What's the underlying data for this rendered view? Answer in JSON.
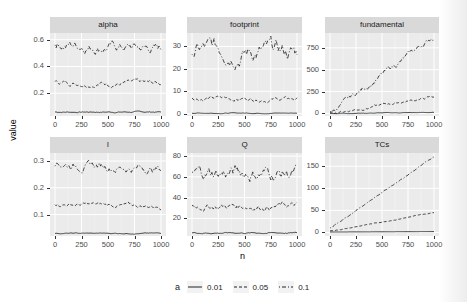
{
  "chart_data": {
    "type": "line",
    "layout": "facet_wrap 2x3, free y scales",
    "xlabel": "n",
    "ylabel": "value",
    "x_ticks": [
      "0",
      "250",
      "500",
      "750",
      "1000"
    ],
    "xlim": [
      0,
      1000
    ],
    "grid": true,
    "legend": {
      "title": "a",
      "position": "bottom",
      "entries": [
        {
          "label": "0.01",
          "linetype": "solid"
        },
        {
          "label": "0.05",
          "linetype": "dashed"
        },
        {
          "label": "0.1",
          "linetype": "dotdash"
        }
      ]
    },
    "panels": [
      {
        "title": "alpha",
        "y_ticks": [
          "0.2",
          "0.4",
          "0.6"
        ],
        "ylim": [
          0.03,
          0.65
        ],
        "series": [
          {
            "name": "0.01",
            "level": 0.06,
            "trend": 0,
            "noise": 0.003
          },
          {
            "name": "0.05",
            "level": 0.28,
            "trend": -0.01,
            "noise": 0.012
          },
          {
            "name": "0.1",
            "level": 0.57,
            "trend": -0.04,
            "noise": 0.025
          }
        ]
      },
      {
        "title": "footprint",
        "y_ticks": [
          "0",
          "10",
          "20",
          "30"
        ],
        "ylim": [
          -1,
          36
        ],
        "series": [
          {
            "name": "0.01",
            "level": 0.3,
            "trend": 0,
            "noise": 0.1
          },
          {
            "name": "0.05",
            "level": 7,
            "trend": -0.5,
            "noise": 0.6
          },
          {
            "name": "0.1",
            "level": 29,
            "trend": -2,
            "noise": 2.5
          }
        ]
      },
      {
        "title": "fundamental",
        "y_ticks": [
          "0",
          "250",
          "500",
          "750"
        ],
        "ylim": [
          -30,
          920
        ],
        "series": [
          {
            "name": "0.01",
            "level": 0,
            "trend": 10,
            "noise": 2
          },
          {
            "name": "0.05",
            "level": 0,
            "trend": 190,
            "noise": 10
          },
          {
            "name": "0.1",
            "level": 0,
            "trend": 880,
            "noise": 20
          }
        ]
      },
      {
        "title": "l",
        "y_ticks": [
          "0.1",
          "0.2",
          "0.3"
        ],
        "ylim": [
          0.02,
          0.33
        ],
        "series": [
          {
            "name": "0.01",
            "level": 0.03,
            "trend": 0,
            "noise": 0.001
          },
          {
            "name": "0.05",
            "level": 0.14,
            "trend": -0.01,
            "noise": 0.005
          },
          {
            "name": "0.1",
            "level": 0.29,
            "trend": -0.02,
            "noise": 0.01
          }
        ]
      },
      {
        "title": "Q",
        "y_ticks": [
          "20",
          "40",
          "60",
          "80"
        ],
        "ylim": [
          3,
          83
        ],
        "series": [
          {
            "name": "0.01",
            "level": 6,
            "trend": 0,
            "noise": 0.4
          },
          {
            "name": "0.05",
            "level": 32,
            "trend": 0,
            "noise": 2
          },
          {
            "name": "0.1",
            "level": 64,
            "trend": 0,
            "noise": 4.5
          }
        ]
      },
      {
        "title": "TCs",
        "y_ticks": [
          "0",
          "50",
          "100",
          "150"
        ],
        "ylim": [
          -8,
          180
        ],
        "series": [
          {
            "name": "0.01",
            "level": 1,
            "trend": 1,
            "noise": 0
          },
          {
            "name": "0.05",
            "level": 3,
            "trend": 42,
            "noise": 0.5
          },
          {
            "name": "0.1",
            "level": 10,
            "trend": 162,
            "noise": 0.8
          }
        ]
      }
    ]
  },
  "labels": {
    "panel_titles": [
      "alpha",
      "footprint",
      "fundamental",
      "l",
      "Q",
      "TCs"
    ],
    "x_axis_title": "n",
    "y_axis_title": "value",
    "legend_title": "a",
    "legend_entries": [
      "0.01",
      "0.05",
      "0.1"
    ]
  }
}
